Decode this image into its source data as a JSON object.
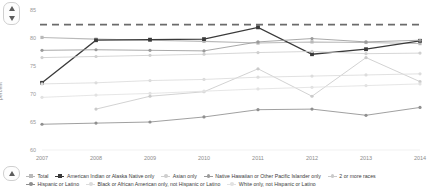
{
  "controls": {
    "scroll_up": "up-arrow",
    "scroll_down": "down-arrow"
  },
  "axis": {
    "ylabel": "percent",
    "yticks": [
      "85",
      "80",
      "75",
      "70",
      "65",
      "60"
    ],
    "xticks": [
      "2007",
      "2008",
      "2009",
      "2010",
      "2011",
      "2012",
      "2013",
      "2014"
    ]
  },
  "chart_data": {
    "type": "line",
    "title": "",
    "xlabel": "",
    "ylabel": "percent",
    "x": [
      2007,
      2008,
      2009,
      2010,
      2011,
      2012,
      2013,
      2014
    ],
    "ylim": [
      60,
      85
    ],
    "xlim": [
      2007,
      2014
    ],
    "grid": false,
    "legend_position": "bottom",
    "target_line": {
      "label": "Target",
      "value": 82.4,
      "style": "dashed",
      "color": "#6b6b6b"
    },
    "series": [
      {
        "name": "Total",
        "color": "#b9b9b9",
        "marker": "square",
        "values": [
          80.1,
          79.8,
          79.6,
          79.4,
          79.1,
          79.3,
          79.2,
          79.0
        ]
      },
      {
        "name": "American Indian or Alaska Native only",
        "color": "#3a3a3a",
        "marker": "square",
        "values": [
          72.0,
          79.6,
          79.7,
          79.8,
          81.9,
          77.1,
          78.0,
          79.5
        ]
      },
      {
        "name": "Asian only",
        "color": "#cfcfcf",
        "marker": "circle",
        "values": [
          76.5,
          76.7,
          76.9,
          77.1,
          77.4,
          77.6,
          77.2,
          77.3
        ]
      },
      {
        "name": "Native Hawaiian or Other Pacific Islander only",
        "color": "#9a9a9a",
        "marker": "circle",
        "values": [
          77.8,
          77.9,
          77.8,
          77.7,
          79.3,
          79.9,
          79.3,
          79.6
        ]
      },
      {
        "name": "2 or more races",
        "color": "#cacaca",
        "marker": "circle",
        "values": [
          null,
          67.3,
          69.6,
          70.4,
          74.5,
          69.6,
          76.5,
          72.2
        ]
      },
      {
        "name": "Hispanic or Latino",
        "color": "#8f8f8f",
        "marker": "circle",
        "values": [
          64.6,
          64.8,
          65.0,
          65.9,
          67.2,
          67.3,
          66.2,
          67.6
        ]
      },
      {
        "name": "Black or African American only, not Hispanic or Latino",
        "color": "#dcdcdc",
        "marker": "circle",
        "values": [
          71.8,
          72.0,
          72.4,
          72.6,
          73.0,
          73.2,
          73.4,
          73.6
        ]
      },
      {
        "name": "White only, not Hispanic or Latino",
        "color": "#e2e2e2",
        "marker": "circle",
        "values": [
          69.4,
          69.8,
          70.1,
          70.5,
          70.9,
          71.2,
          71.5,
          71.8
        ]
      }
    ]
  },
  "legend": [
    {
      "label": "Total",
      "color": "#b9b9b9",
      "marker": "square"
    },
    {
      "label": "American Indian or Alaska Native only",
      "color": "#3a3a3a",
      "marker": "square"
    },
    {
      "label": "Asian only",
      "color": "#cfcfcf",
      "marker": "circle"
    },
    {
      "label": "Native Hawaiian or Other Pacific Islander only",
      "color": "#9a9a9a",
      "marker": "circle"
    },
    {
      "label": "2 or more races",
      "color": "#cacaca",
      "marker": "circle"
    },
    {
      "label": "Hispanic or Latino",
      "color": "#8f8f8f",
      "marker": "circle"
    },
    {
      "label": "Black or African American only, not Hispanic or Latino",
      "color": "#dcdcdc",
      "marker": "circle"
    },
    {
      "label": "White only, not Hispanic or Latino",
      "color": "#e2e2e2",
      "marker": "circle"
    }
  ]
}
